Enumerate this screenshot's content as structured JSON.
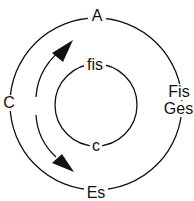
{
  "diagram": {
    "outer_labels": {
      "top": "A",
      "left": "C",
      "right_line1": "Fis",
      "right_line2": "Ges",
      "bottom": "Es"
    },
    "inner_labels": {
      "top": "fis",
      "bottom": "c"
    },
    "colors": {
      "stroke": "#111111",
      "background": "#ffffff"
    }
  }
}
